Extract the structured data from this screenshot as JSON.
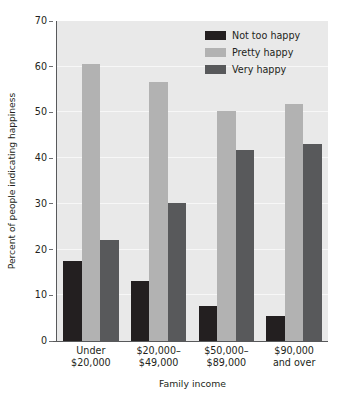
{
  "chart_data": {
    "type": "bar",
    "title": "",
    "subtitle": "",
    "xlabel": "Family income",
    "ylabel": "Percent of people indicating happiness",
    "categories": [
      "Under\n$20,000",
      "$20,000–\n$49,000",
      "$50,000–\n$89,000",
      "$90,000\nand over"
    ],
    "category_lines": [
      [
        "Under",
        "$20,000"
      ],
      [
        "$20,000–",
        "$49,000"
      ],
      [
        "$50,000–",
        "$89,000"
      ],
      [
        "$90,000",
        "and over"
      ]
    ],
    "series": [
      {
        "name": "Not too happy",
        "color": "#231f20",
        "values": [
          17.4,
          13.1,
          7.6,
          5.5
        ]
      },
      {
        "name": "Pretty happy",
        "color": "#b2b2b2",
        "values": [
          60.5,
          56.6,
          50.4,
          51.8
        ]
      },
      {
        "name": "Very happy",
        "color": "#58595b",
        "values": [
          22.2,
          30.2,
          41.8,
          43.0
        ]
      }
    ],
    "ylim": [
      0,
      70
    ],
    "yticks": [
      0,
      10,
      20,
      30,
      40,
      50,
      60,
      70
    ],
    "ytick_labels": [
      "0",
      "10",
      "20",
      "30",
      "40",
      "50",
      "60",
      "70"
    ],
    "grid": true,
    "grid_color": "#f7f7f7",
    "plot_background": "#e9e9e9",
    "legend_position": "top-right",
    "axis_color": "#58595b"
  }
}
